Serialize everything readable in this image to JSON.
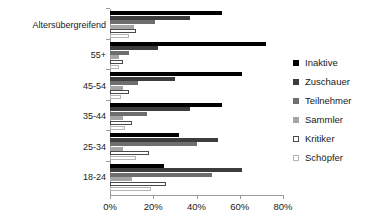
{
  "chart_data": {
    "type": "bar",
    "orientation": "horizontal",
    "title": "",
    "subtitle": "",
    "xlabel": "",
    "ylabel": "",
    "xlim": [
      0,
      80
    ],
    "xtick_labels": [
      "0%",
      "20%",
      "40%",
      "60%",
      "80%"
    ],
    "xtick_values": [
      0,
      20,
      40,
      60,
      80
    ],
    "grid": false,
    "legend_position": "right",
    "categories": [
      "Altersübergreifend",
      "55+",
      "45-54",
      "35-44",
      "25-34",
      "18-24"
    ],
    "series": [
      {
        "name": "Inaktive",
        "color": "#000000",
        "values": [
          52,
          72,
          61,
          52,
          32,
          25
        ]
      },
      {
        "name": "Zuschauer",
        "color": "#3d3d3d",
        "values": [
          37,
          22,
          30,
          37,
          50,
          61
        ]
      },
      {
        "name": "Teilnehmer",
        "color": "#6e6e6e",
        "values": [
          21,
          9,
          13,
          17,
          40,
          47
        ]
      },
      {
        "name": "Sammler",
        "color": "#a6a6a6",
        "values": [
          11,
          4,
          6,
          6,
          6,
          10
        ]
      },
      {
        "name": "Kritiker",
        "color": "#ffffff",
        "values": [
          12,
          6,
          9,
          10,
          18,
          26
        ]
      },
      {
        "name": "Schöpfer",
        "color": "#ffffff",
        "values": [
          9,
          4,
          5,
          7,
          12,
          19
        ]
      }
    ]
  },
  "legend": {
    "items": [
      {
        "label": "Inaktive"
      },
      {
        "label": "Zuschauer"
      },
      {
        "label": "Teilnehmer"
      },
      {
        "label": "Sammler"
      },
      {
        "label": "Kritiker"
      },
      {
        "label": "Schöpfer"
      }
    ]
  },
  "y_axis": {
    "labels": [
      "Altersübergreifend",
      "55+",
      "45-54",
      "35-44",
      "25-34",
      "18-24"
    ]
  },
  "x_axis": {
    "labels": [
      "0%",
      "20%",
      "40%",
      "60%",
      "80%"
    ]
  }
}
